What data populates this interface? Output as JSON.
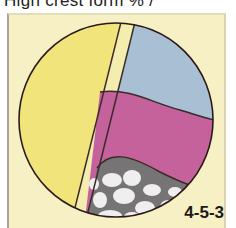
{
  "header": {
    "title": "High crest form % /"
  },
  "figure": {
    "label": "4-5-3",
    "background_color": "#f6f0c4",
    "regions": [
      {
        "name": "yellow-layer",
        "color": "#f1e47a"
      },
      {
        "name": "pale-yellow-strip",
        "color": "#f3edb0"
      },
      {
        "name": "blue-layer",
        "color": "#a9c0d4"
      },
      {
        "name": "pink-layer",
        "color": "#c5629b"
      },
      {
        "name": "gray-cellular-layer",
        "color": "#767474"
      },
      {
        "name": "white-cells",
        "color": "#efefef"
      }
    ]
  }
}
